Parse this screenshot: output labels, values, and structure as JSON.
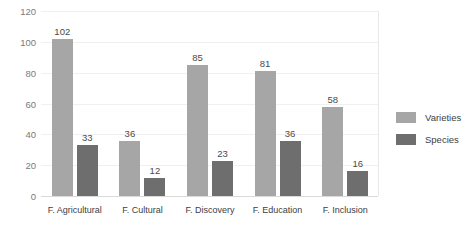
{
  "chart_data": {
    "type": "bar",
    "title": "",
    "subtitle": "",
    "xlabel": "",
    "ylabel": "",
    "ylim": [
      0,
      120
    ],
    "ytick_step": 20,
    "yticks": [
      0,
      20,
      40,
      60,
      80,
      100,
      120
    ],
    "grid": true,
    "grid_axis": "y",
    "legend_position": "right",
    "categories": [
      "F. Agricultural",
      "F. Cultural",
      "F. Discovery",
      "F. Education",
      "F. Inclusion"
    ],
    "series": [
      {
        "name": "Varieties",
        "color": "#a6a6a6",
        "values": [
          102,
          36,
          85,
          81,
          58
        ]
      },
      {
        "name": "Species",
        "color": "#6e6e6e",
        "values": [
          33,
          12,
          23,
          36,
          16
        ]
      }
    ],
    "data_labels": true
  },
  "colors": {
    "background": "#ffffff",
    "varieties": "#a6a6a6",
    "species": "#6e6e6e",
    "gridline": "#f0f0f0",
    "axis_line": "#d9d9d9",
    "tick_text": "#7a7a7a",
    "label_text": "#404040"
  }
}
